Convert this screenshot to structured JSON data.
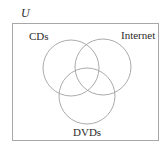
{
  "diagram": {
    "type": "venn",
    "universe": {
      "label": "U",
      "rect": {
        "x": 12,
        "y": 23,
        "width": 146,
        "height": 117
      },
      "stroke": "#a8a8a8"
    },
    "sets": [
      {
        "id": "cds",
        "label": "CDs",
        "cx": 71,
        "cy": 68,
        "r": 28
      },
      {
        "id": "internet",
        "label": "Internet",
        "cx": 103,
        "cy": 67,
        "r": 28
      },
      {
        "id": "dvds",
        "label": "DVDs",
        "cx": 87,
        "cy": 96,
        "r": 28
      }
    ],
    "circle_stroke": "#a0a0a0",
    "text_color": "#2b2b2b"
  }
}
